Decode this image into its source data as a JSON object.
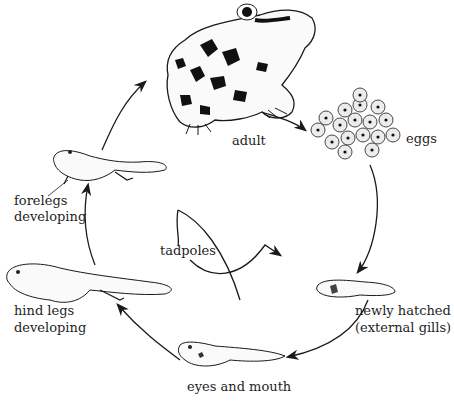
{
  "diagram": {
    "stages": [
      {
        "id": "adult",
        "label": "adult"
      },
      {
        "id": "eggs",
        "label": "eggs"
      },
      {
        "id": "newly_hatched",
        "label_line1": "newly hatched",
        "label_line2": "(external gills)"
      },
      {
        "id": "eyes_mouth",
        "label": "eyes and mouth"
      },
      {
        "id": "hind_legs",
        "label_line1": "hind legs",
        "label_line2": "developing"
      },
      {
        "id": "forelegs",
        "label_line1": "forelegs",
        "label_line2": "developing"
      }
    ],
    "group_label": "tadpoles",
    "colors": {
      "ink": "#1a1a1a",
      "background": "#ffffff",
      "egg_fill": "#e8e8e8"
    }
  }
}
